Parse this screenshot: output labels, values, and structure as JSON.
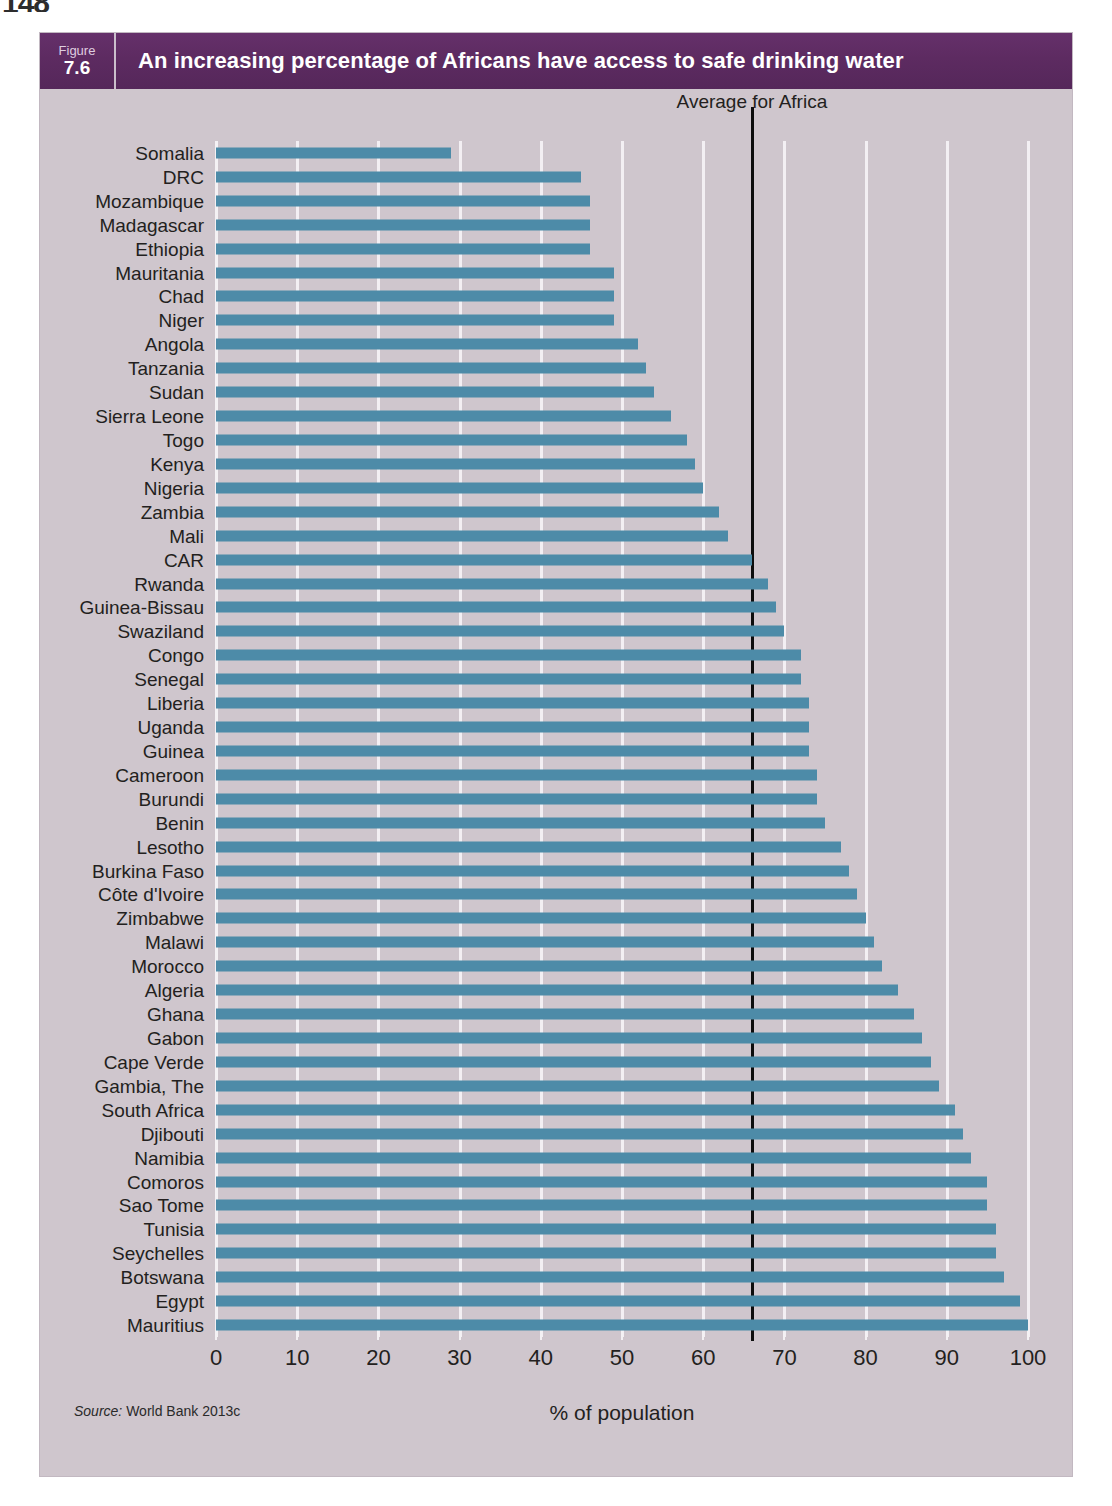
{
  "page": {
    "page_number": "148"
  },
  "figure": {
    "label_word": "Figure",
    "number": "7.6",
    "title": "An increasing percentage of Africans have access to safe drinking water",
    "source": {
      "prefix": "Source:",
      "text": " World Bank 2013c"
    },
    "header_color": "#5d2b61",
    "panel_color": "#cfc6cd",
    "bar_color": "#4d8ba8",
    "gridline_color": "#f4f1f4",
    "average_line_color": "#0d0d0d"
  },
  "chart_data": {
    "type": "bar",
    "orientation": "horizontal",
    "title": "An increasing percentage of Africans have access to safe drinking water",
    "xlabel": "% of population",
    "ylabel": "",
    "xlim": [
      0,
      100
    ],
    "xticks": [
      0,
      10,
      20,
      30,
      40,
      50,
      60,
      70,
      80,
      90,
      100
    ],
    "xtick_labels": [
      "0",
      "10",
      "20",
      "30",
      "40",
      "50",
      "60",
      "70",
      "80",
      "90",
      "100"
    ],
    "grid": true,
    "legend": null,
    "annotations": [
      {
        "name": "average-for-africa",
        "label": "Average for Africa",
        "value": 66
      }
    ],
    "categories": [
      "Somalia",
      "DRC",
      "Mozambique",
      "Madagascar",
      "Ethiopia",
      "Mauritania",
      "Chad",
      "Niger",
      "Angola",
      "Tanzania",
      "Sudan",
      "Sierra Leone",
      "Togo",
      "Kenya",
      "Nigeria",
      "Zambia",
      "Mali",
      "CAR",
      "Rwanda",
      "Guinea-Bissau",
      "Swaziland",
      "Congo",
      "Senegal",
      "Liberia",
      "Uganda",
      "Guinea",
      "Cameroon",
      "Burundi",
      "Benin",
      "Lesotho",
      "Burkina Faso",
      "Côte d'Ivoire",
      "Zimbabwe",
      "Malawi",
      "Morocco",
      "Algeria",
      "Ghana",
      "Gabon",
      "Cape Verde",
      "Gambia, The",
      "South Africa",
      "Djibouti",
      "Namibia",
      "Comoros",
      "Sao Tome",
      "Tunisia",
      "Seychelles",
      "Botswana",
      "Egypt",
      "Mauritius"
    ],
    "values": [
      29,
      45,
      46,
      46,
      46,
      49,
      49,
      49,
      52,
      53,
      54,
      56,
      58,
      59,
      60,
      62,
      63,
      66,
      68,
      69,
      70,
      72,
      72,
      73,
      73,
      73,
      74,
      74,
      75,
      77,
      78,
      79,
      80,
      81,
      82,
      84,
      86,
      87,
      88,
      89,
      91,
      92,
      93,
      95,
      95,
      96,
      96,
      97,
      99,
      100
    ]
  }
}
